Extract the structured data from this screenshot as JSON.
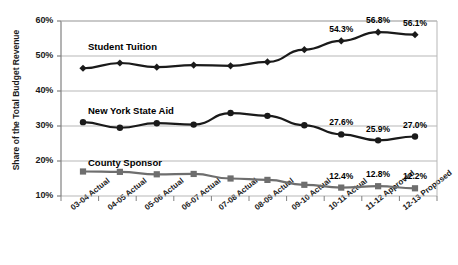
{
  "chart_data": {
    "type": "line",
    "title": "",
    "xlabel": "",
    "ylabel": "Share of the Total Budget Revenue",
    "ylim": [
      10,
      60
    ],
    "yticks": [
      "10%",
      "20%",
      "30%",
      "40%",
      "50%",
      "60%"
    ],
    "ytick_values": [
      10,
      20,
      30,
      40,
      50,
      60
    ],
    "grid": true,
    "legend_position": "inline-labels",
    "categories": [
      "03-04 Actual",
      "04-05 Actual",
      "05-06 Actual",
      "06-07 Actual",
      "07-08 Actual",
      "08-09 Actual",
      "09-10 Actual",
      "10-11 Actual",
      "11-12 Approved",
      "12-13 Proposed"
    ],
    "series": [
      {
        "name": "Student Tuition",
        "marker": "diamond",
        "color": "#1a1a1a",
        "values": [
          46.5,
          48.0,
          46.8,
          47.4,
          47.2,
          48.3,
          51.8,
          54.3,
          56.8,
          56.1
        ],
        "labels": [
          null,
          null,
          null,
          null,
          null,
          null,
          null,
          "54.3%",
          "56.8%",
          "56.1%"
        ]
      },
      {
        "name": "New York State Aid",
        "marker": "circle",
        "color": "#1a1a1a",
        "values": [
          31.1,
          29.5,
          30.8,
          30.4,
          33.7,
          32.9,
          30.2,
          27.6,
          25.9,
          27.0
        ],
        "labels": [
          null,
          null,
          null,
          null,
          null,
          null,
          null,
          "27.6%",
          "25.9%",
          "27.0%"
        ]
      },
      {
        "name": "County Sponsor",
        "marker": "square",
        "color": "#6e6e6e",
        "values": [
          17.0,
          16.9,
          16.2,
          16.3,
          15.0,
          14.6,
          13.2,
          12.4,
          12.8,
          12.2
        ],
        "labels": [
          null,
          null,
          null,
          null,
          null,
          null,
          null,
          "12.4%",
          "12.8%",
          "12.2%"
        ]
      }
    ]
  },
  "axis": {
    "y_title": "Share of the Total Budget Revenue"
  },
  "colors": {
    "dark_series": "#1a1a1a",
    "gray_series": "#6e6e6e",
    "gridline": "#b7b7b7",
    "axis": "#808080",
    "background": "#ffffff"
  }
}
